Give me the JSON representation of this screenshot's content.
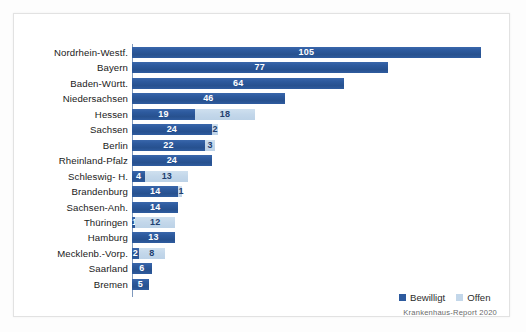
{
  "chart_data": {
    "type": "bar",
    "orientation": "horizontal",
    "stacked": true,
    "title": "",
    "xlabel": "",
    "ylabel": "",
    "grid": false,
    "xlim": [
      0,
      112
    ],
    "px_per_unit": 3.32,
    "categories": [
      "Nordrhein-Westf.",
      "Bayern",
      "Baden-Württ.",
      "Niedersachsen",
      "Hessen",
      "Sachsen",
      "Berlin",
      "Rheinland-Pfalz",
      "Schleswig- H.",
      "Brandenburg",
      "Sachsen-Anh.",
      "Thüringen",
      "Hamburg",
      "Mecklenb.-Vorp.",
      "Saarland",
      "Bremen"
    ],
    "series": [
      {
        "name": "Bewilligt",
        "color": "#2d5a9e",
        "values": [
          105,
          77,
          64,
          46,
          19,
          24,
          22,
          24,
          4,
          14,
          14,
          1,
          13,
          2,
          6,
          5
        ]
      },
      {
        "name": "Offen",
        "color": "#c3d7ea",
        "values": [
          0,
          0,
          0,
          0,
          18,
          2,
          3,
          0,
          13,
          1,
          0,
          12,
          0,
          8,
          0,
          0
        ]
      }
    ],
    "legend": {
      "position": "bottom-right",
      "entries": [
        {
          "label": "Bewilligt",
          "color": "#2d5a9e"
        },
        {
          "label": "Offen",
          "color": "#c3d7ea"
        }
      ]
    },
    "source": "Krankenhaus-Report 2020"
  },
  "legend": {
    "bewilligt_label": "Bewilligt",
    "offen_label": "Offen"
  },
  "footer": {
    "source_text": "Krankenhaus-Report 2020"
  },
  "colors": {
    "bar_bewilligt": "#2d5a9e",
    "bar_offen": "#c3d7ea",
    "axis": "#7f99bd",
    "frame": "#e2e2e2",
    "label_text": "#1a1a1a",
    "source_text": "#6a6a6a"
  }
}
